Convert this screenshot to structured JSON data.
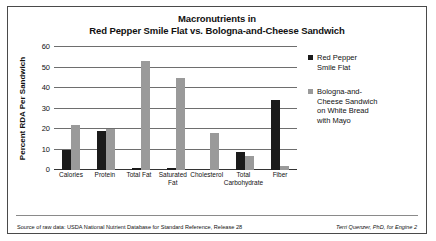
{
  "chart_data": {
    "type": "bar",
    "title": "Macronutrients in Red Pepper Smile Flat vs. Bologna-and-Cheese Sandwich",
    "title_line1": "Macronutrients in",
    "title_line2": "Red Pepper Smile Flat vs. Bologna-and-Cheese Sandwich",
    "xlabel": "",
    "ylabel": "Percent RDA Per Sandwich",
    "ylim": [
      0,
      60
    ],
    "yticks": [
      0,
      10,
      20,
      30,
      40,
      50,
      60
    ],
    "grid": true,
    "legend_position": "right",
    "categories": [
      "Calories",
      "Protein",
      "Total Fat",
      "Saturated\nFat",
      "Cholesterol",
      "Total\nCarbohydrate",
      "Fiber"
    ],
    "series": [
      {
        "name": "Red Pepper Smile Flat",
        "name_display": "Red Pepper\nSmile Flat",
        "color": "#1b1b1b",
        "values": [
          10,
          19,
          1,
          1,
          0,
          9,
          34
        ]
      },
      {
        "name": "Bologna-and-Cheese Sandwich on White Bread with Mayo",
        "name_display": "Bologna-and-\nCheese Sandwich\non White Bread\nwith Mayo",
        "color": "#9a9a9a",
        "values": [
          22,
          20,
          53,
          45,
          18,
          7,
          2
        ]
      }
    ]
  },
  "footer": {
    "source": "Source of raw data: USDA National Nutrient Database for Standard Reference, Release 28",
    "credit": "Terri Quenzer, PhD, for Engine 2"
  }
}
